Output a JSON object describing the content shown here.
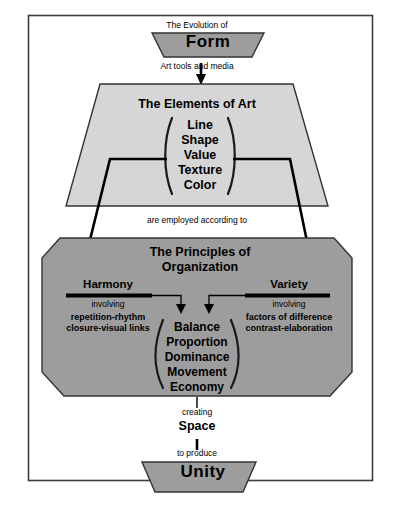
{
  "diagram": {
    "title_top": "The Evolution of",
    "form_box": "Form",
    "connector_1": "Art tools   and media",
    "elements_box": {
      "heading": "The Elements of Art",
      "items": [
        "Line",
        "Shape",
        "Value",
        "Texture",
        "Color"
      ]
    },
    "connector_2": "are employed according to",
    "principles_box": {
      "heading_line1": "The Principles of",
      "heading_line2": "Organization",
      "left_branch": {
        "label": "Harmony",
        "sub": "involving",
        "details": [
          "repetition-rhythm",
          "closure-visual links"
        ]
      },
      "right_branch": {
        "label": "Variety",
        "sub": "involving",
        "details": [
          "factors of difference",
          "contrast-elaboration"
        ]
      },
      "center_items": [
        "Balance",
        "Proportion",
        "Dominance",
        "Movement",
        "Economy"
      ]
    },
    "connector_3": "creating",
    "space_label": "Space",
    "connector_4": "to produce",
    "unity_box": "Unity",
    "colors": {
      "page_background": "#ffffff",
      "frame_border": "#3d3d3d",
      "form_fill": "#9d9d9d",
      "elements_fill": "#d6d6d6",
      "principles_fill": "#9d9d9d",
      "unity_fill": "#9d9d9d",
      "shape_stroke": "#333333",
      "arrow_color": "#000000"
    }
  }
}
